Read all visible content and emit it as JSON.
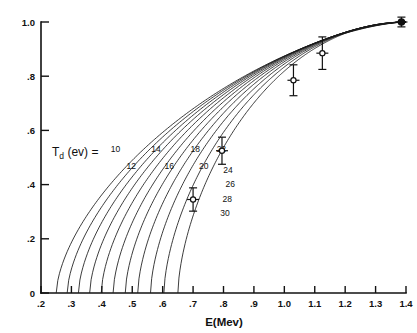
{
  "chart_data": {
    "type": "line",
    "title": "",
    "xlabel": "E(Mev)",
    "ylabel": "",
    "series_label": "T",
    "series_label_sub": "d",
    "series_label_tail": " (ev) =",
    "xlim": [
      0.15,
      1.45
    ],
    "ylim": [
      0.0,
      1.05
    ],
    "grid": false,
    "legend_position": "inline-curve-labels",
    "xticks": [
      0.2,
      0.3,
      0.4,
      0.5,
      0.6,
      0.7,
      0.8,
      0.9,
      1.0,
      1.1,
      1.2,
      1.3,
      1.4
    ],
    "xtick_labels": [
      ".2",
      ".3",
      ".4",
      ".5",
      ".6",
      ".7",
      ".8",
      ".9",
      "1.0",
      "1.1",
      "1.2",
      "1.3",
      "1.4"
    ],
    "yticks": [
      0,
      0.2,
      0.4,
      0.6,
      0.8,
      1.0
    ],
    "ytick_labels": [
      "0",
      ".2",
      ".4",
      ".6",
      ".8",
      "1.0"
    ],
    "series": [
      {
        "name": "10",
        "threshold": 0.25,
        "label_x": 0.445,
        "label_y": 0.522
      },
      {
        "name": "12",
        "threshold": 0.286,
        "label_x": 0.497,
        "label_y": 0.458
      },
      {
        "name": "14",
        "threshold": 0.323,
        "label_x": 0.578,
        "label_y": 0.522
      },
      {
        "name": "16",
        "threshold": 0.36,
        "label_x": 0.622,
        "label_y": 0.458
      },
      {
        "name": "18",
        "threshold": 0.398,
        "label_x": 0.707,
        "label_y": 0.522
      },
      {
        "name": "20",
        "threshold": 0.437,
        "label_x": 0.735,
        "label_y": 0.458
      },
      {
        "name": "22",
        "threshold": 0.477,
        "label_x": 0.793,
        "label_y": 0.522
      },
      {
        "name": "24",
        "threshold": 0.518,
        "label_x": 0.815,
        "label_y": 0.443
      },
      {
        "name": "26",
        "threshold": 0.56,
        "label_x": 0.822,
        "label_y": 0.39
      },
      {
        "name": "28",
        "threshold": 0.604,
        "label_x": 0.812,
        "label_y": 0.335
      },
      {
        "name": "30",
        "threshold": 0.65,
        "label_x": 0.805,
        "label_y": 0.283
      }
    ],
    "data_points": [
      {
        "x": 0.7,
        "y": 0.345,
        "yerr_low": 0.043,
        "yerr_high": 0.043,
        "marker": "open"
      },
      {
        "x": 0.795,
        "y": 0.525,
        "yerr_low": 0.05,
        "yerr_high": 0.05,
        "marker": "open"
      },
      {
        "x": 1.03,
        "y": 0.785,
        "yerr_low": 0.057,
        "yerr_high": 0.057,
        "marker": "open"
      },
      {
        "x": 1.125,
        "y": 0.885,
        "yerr_low": 0.06,
        "yerr_high": 0.06,
        "marker": "open"
      },
      {
        "x": 1.385,
        "y": 1.0,
        "yerr_low": 0.018,
        "yerr_high": 0.018,
        "marker": "solid"
      }
    ]
  }
}
